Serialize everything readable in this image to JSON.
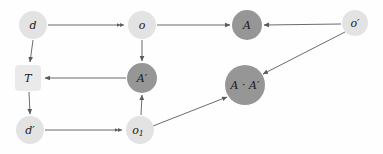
{
  "diagram": {
    "type": "commutative-diagram",
    "background_color": "#fefefe",
    "edge_color": "#5a5a5a",
    "label_color": "#1a1a1a",
    "palette": {
      "light_node": "#e3e3e3",
      "dark_node": "#969696",
      "square_node": "#eaeaea"
    },
    "nodes": [
      {
        "id": "d",
        "label": "d",
        "shape": "circle",
        "cx": 33,
        "cy": 25,
        "r": 14,
        "fill": "#e3e3e3"
      },
      {
        "id": "o",
        "label": "o",
        "shape": "circle",
        "cx": 142,
        "cy": 25,
        "r": 14,
        "fill": "#e3e3e3"
      },
      {
        "id": "A",
        "label": "A",
        "shape": "circle",
        "cx": 247,
        "cy": 25,
        "r": 15,
        "fill": "#969696"
      },
      {
        "id": "oprime",
        "label": "o′",
        "shape": "circle",
        "cx": 355,
        "cy": 23,
        "r": 13,
        "fill": "#e3e3e3"
      },
      {
        "id": "T",
        "label": "T",
        "shape": "rounded-square",
        "cx": 28,
        "cy": 78,
        "size": 26,
        "fill": "#eaeaea"
      },
      {
        "id": "Aprime",
        "label": "A′",
        "shape": "circle",
        "cx": 142,
        "cy": 78,
        "r": 15,
        "fill": "#969696"
      },
      {
        "id": "AdotAprime",
        "label": "A · A′",
        "shape": "circle",
        "cx": 245,
        "cy": 85,
        "r": 20,
        "fill": "#969696"
      },
      {
        "id": "dprime",
        "label": "d′",
        "shape": "circle",
        "cx": 30,
        "cy": 130,
        "r": 14,
        "fill": "#e3e3e3"
      },
      {
        "id": "o1",
        "label": "o",
        "sublabel": "1",
        "shape": "circle",
        "cx": 140,
        "cy": 130,
        "r": 14,
        "fill": "#e3e3e3"
      }
    ],
    "edges": [
      {
        "id": "d-to-o",
        "from": "d",
        "to": "o",
        "arrowhead": "double"
      },
      {
        "id": "d-to-T",
        "from": "d",
        "to": "T",
        "arrowhead": "single"
      },
      {
        "id": "o-to-A",
        "from": "o",
        "to": "A",
        "arrowhead": "single"
      },
      {
        "id": "oprime-to-A",
        "from": "o′",
        "to": "A",
        "arrowhead": "single"
      },
      {
        "id": "o-to-Aprime",
        "from": "o",
        "to": "A′",
        "arrowhead": "single"
      },
      {
        "id": "Aprime-to-T",
        "from": "A′",
        "to": "T",
        "arrowhead": "single"
      },
      {
        "id": "o1-to-Aprime",
        "from": "o1",
        "to": "A′",
        "arrowhead": "single"
      },
      {
        "id": "T-to-dprime",
        "from": "T",
        "to": "d′",
        "arrowhead": "single"
      },
      {
        "id": "dprime-to-o1",
        "from": "d′",
        "to": "o1",
        "arrowhead": "double"
      },
      {
        "id": "o1-to-AdotAprime",
        "from": "o1",
        "to": "A · A′",
        "arrowhead": "single"
      },
      {
        "id": "oprime-to-AdotAprime",
        "from": "o′",
        "to": "A · A′",
        "arrowhead": "single"
      }
    ]
  }
}
